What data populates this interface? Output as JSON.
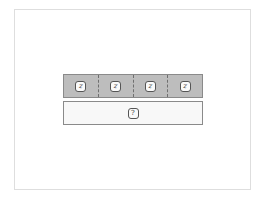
{
  "diagram": {
    "type": "tape-diagram",
    "parts": [
      {
        "label": "z"
      },
      {
        "label": "z"
      },
      {
        "label": "z"
      },
      {
        "label": "z"
      }
    ],
    "total": {
      "label": "?"
    },
    "colors": {
      "part_fill": "#bdbdbd",
      "total_fill": "#f8f8f8",
      "border": "#8a8a8a"
    }
  }
}
